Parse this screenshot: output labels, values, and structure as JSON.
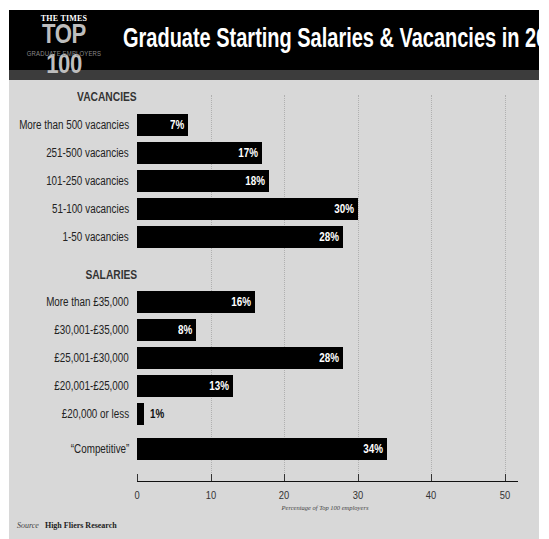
{
  "header": {
    "logo_masthead": "THE TIMES",
    "logo_title": "TOP 100",
    "logo_subtitle": "GRADUATE EMPLOYERS",
    "title": "Graduate Starting Salaries & Vacancies in 2014"
  },
  "sections": {
    "vacancies_heading": "VACANCIES",
    "salaries_heading": "SALARIES"
  },
  "colors": {
    "bar": "#000000",
    "panel_bg": "#d8d8d8",
    "header_bg": "#000000",
    "band": "#3c3c3c"
  },
  "axis": {
    "ticks": [
      "0",
      "10",
      "20",
      "30",
      "40",
      "50"
    ],
    "label": "Percentage of Top 100 employers"
  },
  "source": {
    "key": "Source",
    "value": "High Fliers Research"
  },
  "chart_data": {
    "type": "bar",
    "orientation": "horizontal",
    "title": "Graduate Starting Salaries & Vacancies in 2014",
    "xlabel": "Percentage of Top 100 employers",
    "ylabel": "",
    "xlim": [
      0,
      50
    ],
    "xticks": [
      0,
      10,
      20,
      30,
      40,
      50
    ],
    "grid": true,
    "groups": [
      {
        "name": "VACANCIES",
        "categories": [
          "More than 500 vacancies",
          "251-500 vacancies",
          "101-250 vacancies",
          "51-100 vacancies",
          "1-50 vacancies"
        ],
        "values": [
          7,
          17,
          18,
          30,
          28
        ],
        "labels": [
          "7%",
          "17%",
          "18%",
          "30%",
          "28%"
        ]
      },
      {
        "name": "SALARIES",
        "categories": [
          "More than £35,000",
          "£30,001-£35,000",
          "£25,001-£30,000",
          "£20,001-£25,000",
          "£20,000 or less",
          "“Competitive”"
        ],
        "values": [
          16,
          8,
          28,
          13,
          1,
          34
        ],
        "labels": [
          "16%",
          "8%",
          "28%",
          "13%",
          "1%",
          "34%"
        ]
      }
    ],
    "source": "High Fliers Research"
  }
}
